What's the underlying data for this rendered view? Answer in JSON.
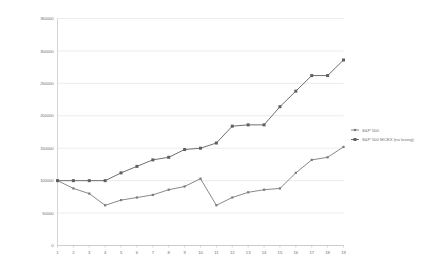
{
  "chart_data": {
    "type": "line",
    "title": "",
    "xlabel": "",
    "ylabel": "",
    "xlim": [
      1,
      19
    ],
    "ylim": [
      0,
      350000
    ],
    "grid": true,
    "legend_position": "right",
    "x": [
      1,
      2,
      3,
      4,
      5,
      6,
      7,
      8,
      9,
      10,
      11,
      12,
      13,
      14,
      15,
      16,
      17,
      18,
      19
    ],
    "ytick_labels": [
      "0",
      "50000",
      "100000",
      "150000",
      "200000",
      "250000",
      "300000",
      "350000"
    ],
    "ytick_values": [
      0,
      50000,
      100000,
      150000,
      200000,
      250000,
      300000,
      350000
    ],
    "xtick_labels": [
      "1",
      "2",
      "3",
      "4",
      "5",
      "6",
      "7",
      "8",
      "9",
      "10",
      "11",
      "12",
      "13",
      "14",
      "15",
      "16",
      "17",
      "18",
      "19"
    ],
    "series": [
      {
        "name": "S&P 500",
        "color": "#7a7a7a",
        "marker": "square",
        "values": [
          100000,
          88000,
          80000,
          62000,
          70000,
          74000,
          78000,
          86000,
          91000,
          103000,
          62000,
          74000,
          82000,
          86000,
          88000,
          112000,
          132000,
          136000,
          152000
        ]
      },
      {
        "name": "S&P 500 MCEX (no losing)",
        "color": "#5f5f5f",
        "marker": "square",
        "values": [
          100000,
          100000,
          100000,
          100000,
          112000,
          122000,
          132000,
          136000,
          148000,
          150000,
          158000,
          184000,
          186000,
          186000,
          214000,
          238000,
          262000,
          262000,
          286000
        ]
      }
    ]
  },
  "legend": {
    "items": [
      {
        "label": "S&P 500"
      },
      {
        "label": "S&P 500 MCEX (no losing)"
      }
    ]
  }
}
